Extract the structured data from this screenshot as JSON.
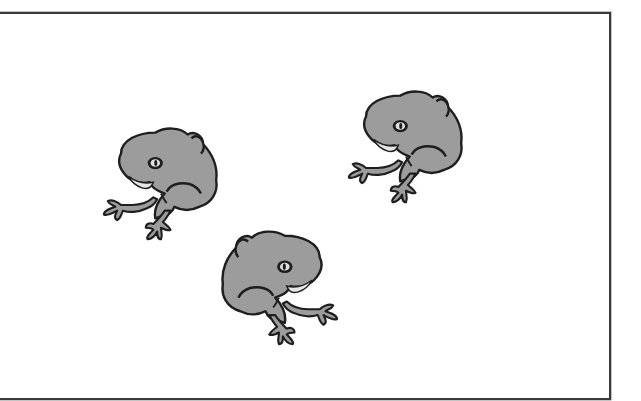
{
  "scene": {
    "description": "Three gray cartoon frogs inside a rectangular frame",
    "colors": {
      "background": "#ffffff",
      "frame": "#3a3a3a",
      "frog_fill": "#9c9c9c",
      "frog_outline": "#1e1e1e",
      "belly": "#e6e6e6"
    },
    "frogs": [
      {
        "id": "frog-left",
        "x": 97,
        "y": 125,
        "w": 128,
        "h": 118,
        "flipped": false
      },
      {
        "id": "frog-right",
        "x": 343,
        "y": 88,
        "w": 126,
        "h": 118,
        "flipped": false
      },
      {
        "id": "frog-bottom",
        "x": 215,
        "y": 228,
        "w": 128,
        "h": 120,
        "flipped": true
      }
    ]
  }
}
